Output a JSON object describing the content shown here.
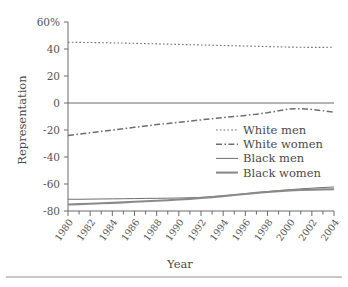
{
  "chart_data": {
    "type": "line",
    "title": "",
    "xlabel": "Year",
    "ylabel": "Representation",
    "xlim": [
      1980,
      2004
    ],
    "ylim": [
      -80,
      60
    ],
    "grid": false,
    "legend_position": "center-right-inside",
    "x": [
      1980,
      1981,
      1982,
      1983,
      1984,
      1985,
      1986,
      1987,
      1988,
      1989,
      1990,
      1991,
      1992,
      1993,
      1994,
      1995,
      1996,
      1997,
      1998,
      1999,
      2000,
      2001,
      2002,
      2003,
      2004
    ],
    "xtick_labels": [
      "1980",
      "1982",
      "1984",
      "1986",
      "1988",
      "1990",
      "1992",
      "1994",
      "1996",
      "1998",
      "2000",
      "2002",
      "2004"
    ],
    "xtick_values": [
      1980,
      1982,
      1984,
      1986,
      1988,
      1990,
      1992,
      1994,
      1996,
      1998,
      2000,
      2002,
      2004
    ],
    "xminor_step": 1,
    "ytick_labels": [
      "60%",
      "40",
      "20",
      "0",
      "-20",
      "-40",
      "-60",
      "-80"
    ],
    "ytick_values": [
      60,
      40,
      20,
      0,
      -20,
      -40,
      -60,
      -80
    ],
    "series": [
      {
        "name": "White men",
        "style": "dotted",
        "color": "#6e6e6e",
        "width": 1.1,
        "values": [
          45.0,
          44.9,
          44.8,
          44.7,
          44.5,
          44.4,
          44.2,
          44.0,
          43.8,
          43.6,
          43.4,
          43.2,
          43.0,
          42.8,
          42.6,
          42.4,
          42.2,
          42.0,
          41.8,
          41.6,
          41.4,
          41.3,
          41.2,
          41.2,
          41.3
        ]
      },
      {
        "name": "White women",
        "style": "dash-dot",
        "color": "#6e6e6e",
        "width": 1.5,
        "values": [
          -24.0,
          -23.0,
          -22.0,
          -21.0,
          -20.0,
          -19.0,
          -18.0,
          -17.0,
          -16.0,
          -15.2,
          -14.3,
          -13.4,
          -12.5,
          -11.6,
          -10.8,
          -10.0,
          -9.2,
          -8.3,
          -7.2,
          -5.8,
          -4.4,
          -4.2,
          -4.8,
          -5.7,
          -6.8
        ]
      },
      {
        "name": "Black men",
        "style": "solid",
        "color": "#6e6e6e",
        "width": 1.0,
        "values": [
          -71.3,
          -71.3,
          -71.2,
          -71.1,
          -71.0,
          -70.9,
          -70.8,
          -70.7,
          -70.6,
          -70.5,
          -70.4,
          -70.2,
          -69.9,
          -69.4,
          -68.8,
          -68.0,
          -67.2,
          -66.4,
          -65.6,
          -64.9,
          -64.2,
          -63.6,
          -63.1,
          -62.6,
          -62.2
        ]
      },
      {
        "name": "Black women",
        "style": "solid",
        "color": "#8a8a8a",
        "width": 2.1,
        "values": [
          -75.2,
          -74.9,
          -74.6,
          -74.3,
          -74.0,
          -73.6,
          -73.2,
          -72.8,
          -72.4,
          -72.0,
          -71.5,
          -71.0,
          -70.4,
          -69.7,
          -69.0,
          -68.2,
          -67.4,
          -66.6,
          -65.9,
          -65.3,
          -64.8,
          -64.5,
          -64.2,
          -64.0,
          -63.9
        ]
      }
    ]
  },
  "legend": {
    "items": [
      {
        "label": "White men"
      },
      {
        "label": "White women"
      },
      {
        "label": "Black men"
      },
      {
        "label": "Black women"
      }
    ]
  }
}
